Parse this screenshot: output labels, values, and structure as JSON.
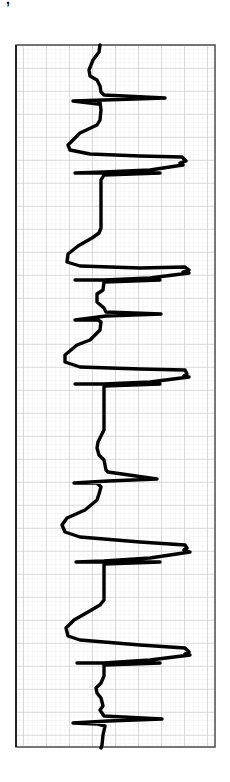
{
  "header": {
    "clipped_text": "ᐩ,ᐝ ⁼⁼ "
  },
  "chart_data": {
    "type": "line",
    "title": "",
    "subtitle": "ECG rhythm strip (vertical orientation)",
    "xlabel": "",
    "ylabel": "",
    "grid": true,
    "legend": "none",
    "orientation": "vertical (time runs top to bottom)",
    "strip_box": {
      "x": 16,
      "y": 45,
      "width": 199,
      "height": 702
    },
    "grid_spacing_major_px": 23,
    "grid_spacing_minor_px": 4.6,
    "colors": {
      "trace": "#000000",
      "grid_major": "#c8c8c8",
      "grid_minor": "#e6e6e6",
      "border": "#333333"
    },
    "beats": [
      {
        "label": "beat-1",
        "type": "narrow",
        "peak_y": 97,
        "qrs_right_x": 165,
        "qrs_left_x": 73
      },
      {
        "label": "beat-2",
        "type": "wide",
        "peak_y": 157,
        "qrs_right_x": 185,
        "qrs_left_x": 75
      },
      {
        "label": "beat-3",
        "type": "wide",
        "peak_y": 268,
        "qrs_right_x": 187,
        "qrs_left_x": 75
      },
      {
        "label": "beat-4",
        "type": "narrow",
        "peak_y": 316,
        "qrs_right_x": 161,
        "qrs_left_x": 75
      },
      {
        "label": "beat-5",
        "type": "wide",
        "peak_y": 370,
        "qrs_right_x": 189,
        "qrs_left_x": 75
      },
      {
        "label": "beat-6",
        "type": "narrow",
        "peak_y": 479,
        "qrs_right_x": 157,
        "qrs_left_x": 74
      },
      {
        "label": "beat-7",
        "type": "wide",
        "peak_y": 552,
        "qrs_right_x": 189,
        "qrs_left_x": 75
      },
      {
        "label": "beat-8",
        "type": "wide",
        "peak_y": 656,
        "qrs_right_x": 191,
        "qrs_left_x": 77
      },
      {
        "label": "beat-9",
        "type": "narrow",
        "peak_y": 722,
        "qrs_right_x": 162,
        "qrs_left_x": 73
      }
    ],
    "trace_points": "100,45 99,52 93,60 89,70 90,76 97,80 100,86 101,92 104,95 165,98 104,100 73,101 98,104 100,102 101,110 100,120 97,125 80,133 68,145 70,150 90,154 140,156 182,157 186,161 180,163 183,165 150,170 104,172 75,173 160,173 104,175 101,180 101,228 99,233 92,238 78,246 68,254 67,262 80,266 140,268 185,267 189,270 183,272 189,273 150,278 104,280 75,280 160,280 104,282 103,290 97,294 97,302 104,308 106,312 161,314 106,316 75,320 98,320 101,322 100,330 97,333 90,340 77,345 65,355 65,362 80,367 140,369 185,370 187,374 184,376 189,377 150,382 104,384 75,384 160,384 104,386 104,430 101,436 98,442 97,448 99,455 104,460 106,470 108,472 157,479 108,481 74,483 97,483 101,487 99,494 97,500 85,510 67,518 62,525 65,532 80,537 140,542 185,545 187,548 184,550 190,552 150,558 104,561 76,562 160,562 104,564 104,600 100,605 88,612 74,620 66,628 68,636 80,640 140,645 185,648 189,652 185,654 190,655 150,660 104,663 77,663 160,663 104,665 104,676 101,683 96,688 97,693 101,698 103,706 100,710 104,716 162,719 108,721 73,723 98,724 105,726 103,735 102,745 101,748"
  }
}
